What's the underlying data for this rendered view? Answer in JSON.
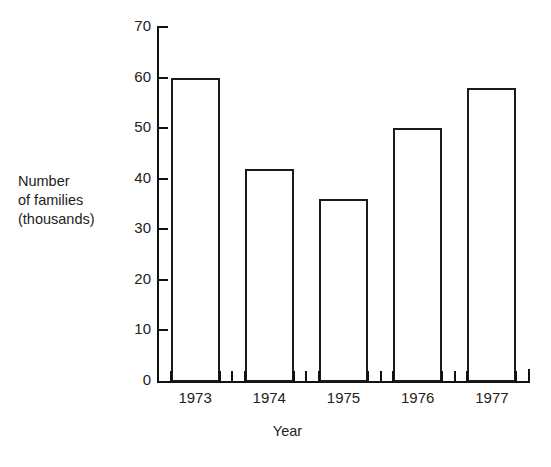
{
  "chart_data": {
    "type": "bar",
    "title": "",
    "categories": [
      "1973",
      "1974",
      "1975",
      "1976",
      "1977"
    ],
    "values": [
      60,
      42,
      36,
      50,
      58
    ],
    "series": [
      {
        "name": "Number of families (thousands)",
        "values": [
          60,
          42,
          36,
          50,
          58
        ]
      }
    ],
    "xlabel": "Year",
    "ylabel": "Number of families (thousands)",
    "ylabel_lines": [
      "Number",
      "of families",
      "(thousands)"
    ],
    "ylim": [
      0,
      70
    ],
    "ytick_labels": [
      "70",
      "60",
      "50",
      "40",
      "30",
      "20",
      "10",
      "0"
    ],
    "ytick_values": [
      70,
      60,
      50,
      40,
      30,
      20,
      10,
      0
    ],
    "ytick_step": 10,
    "grid": false,
    "legend": false,
    "bar_fill_color": "#ffffff",
    "bar_edge_color": "#1b1b1b",
    "axis_color": "#111111",
    "background_color": "#ffffff"
  }
}
